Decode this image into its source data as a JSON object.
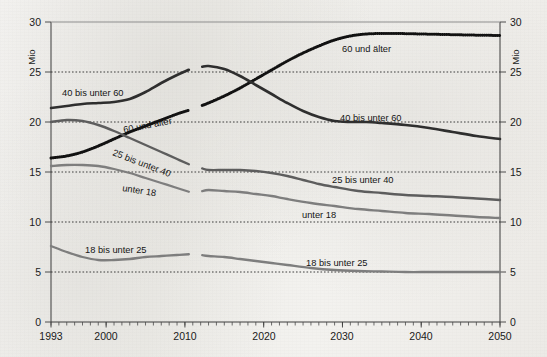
{
  "chart_data": {
    "type": "line",
    "title": "",
    "xlabel": "",
    "ylabel": "Mio",
    "unit_left": "Mio",
    "unit_right": "Mio",
    "xlim": [
      1993,
      2050
    ],
    "ylim": [
      0,
      30
    ],
    "yticks": [
      0,
      5,
      10,
      15,
      20,
      25,
      30
    ],
    "xticks": [
      1993,
      2000,
      2010,
      2020,
      2030,
      2040,
      2050
    ],
    "xtick_labels": [
      "1993",
      "2000",
      "2010",
      "2020",
      "2030",
      "2040",
      "2050"
    ],
    "ytick_labels": [
      "0",
      "5",
      "10",
      "15",
      "20",
      "25",
      "30"
    ],
    "grid": "horizontal-dotted",
    "legend": "inline-annotations",
    "break_year": 2011,
    "series": [
      {
        "name": "60 und älter",
        "style": "dotted-dark",
        "x": [
          1993,
          1995,
          1997,
          1999,
          2001,
          2003,
          2005,
          2007,
          2009,
          2011,
          2013,
          2015,
          2017,
          2019,
          2021,
          2023,
          2025,
          2027,
          2029,
          2031,
          2033,
          2035,
          2037,
          2040,
          2043,
          2046,
          2050
        ],
        "values": [
          16.4,
          16.6,
          17.0,
          17.6,
          18.3,
          19.0,
          19.6,
          20.2,
          20.8,
          21.3,
          21.9,
          22.6,
          23.4,
          24.3,
          25.2,
          26.1,
          26.9,
          27.6,
          28.2,
          28.6,
          28.8,
          28.85,
          28.85,
          28.8,
          28.75,
          28.7,
          28.65
        ]
      },
      {
        "name": "40 bis unter 60",
        "style": "solid-dark",
        "x": [
          1993,
          1995,
          1997,
          1999,
          2001,
          2003,
          2005,
          2007,
          2009,
          2011,
          2013,
          2015,
          2017,
          2019,
          2021,
          2023,
          2025,
          2027,
          2029,
          2031,
          2033,
          2035,
          2038,
          2041,
          2044,
          2047,
          2050
        ],
        "values": [
          21.4,
          21.6,
          21.8,
          21.9,
          22.0,
          22.3,
          23.0,
          23.9,
          24.7,
          25.4,
          25.6,
          25.3,
          24.6,
          23.7,
          22.8,
          21.9,
          21.1,
          20.5,
          20.1,
          20.0,
          20.0,
          19.9,
          19.7,
          19.4,
          19.0,
          18.6,
          18.3
        ]
      },
      {
        "name": "25 bis unter 40",
        "style": "solid-mid",
        "x": [
          1993,
          1995,
          1997,
          1999,
          2001,
          2003,
          2005,
          2007,
          2009,
          2011,
          2013,
          2015,
          2017,
          2019,
          2021,
          2023,
          2025,
          2027,
          2029,
          2032,
          2035,
          2038,
          2041,
          2044,
          2047,
          2050
        ],
        "values": [
          20.0,
          20.2,
          20.1,
          19.7,
          19.1,
          18.4,
          17.7,
          17.0,
          16.3,
          15.6,
          15.2,
          15.2,
          15.2,
          15.1,
          14.9,
          14.6,
          14.2,
          13.8,
          13.5,
          13.1,
          12.9,
          12.7,
          12.6,
          12.5,
          12.35,
          12.2
        ]
      },
      {
        "name": "unter 18",
        "style": "solid-light",
        "x": [
          1993,
          1995,
          1997,
          1999,
          2001,
          2003,
          2005,
          2007,
          2009,
          2011,
          2013,
          2015,
          2017,
          2019,
          2021,
          2023,
          2026,
          2029,
          2032,
          2035,
          2038,
          2041,
          2044,
          2047,
          2050
        ],
        "values": [
          15.6,
          15.7,
          15.7,
          15.6,
          15.3,
          14.9,
          14.4,
          13.9,
          13.4,
          12.9,
          13.2,
          13.1,
          13.0,
          12.8,
          12.6,
          12.3,
          11.9,
          11.6,
          11.3,
          11.1,
          10.9,
          10.8,
          10.65,
          10.5,
          10.4
        ]
      },
      {
        "name": "18 bis unter 25",
        "style": "solid-light",
        "x": [
          1993,
          1995,
          1997,
          1999,
          2001,
          2003,
          2005,
          2007,
          2009,
          2011,
          2013,
          2015,
          2017,
          2019,
          2021,
          2023,
          2026,
          2029,
          2032,
          2035,
          2038,
          2041,
          2044,
          2047,
          2050
        ],
        "values": [
          7.6,
          7.0,
          6.5,
          6.2,
          6.2,
          6.3,
          6.5,
          6.6,
          6.7,
          6.8,
          6.6,
          6.5,
          6.3,
          6.1,
          5.9,
          5.7,
          5.4,
          5.2,
          5.1,
          5.05,
          5.0,
          5.0,
          5.0,
          5.0,
          5.0
        ]
      }
    ],
    "annotations": [
      {
        "text": "60 und älter",
        "series": "60 und älter",
        "placement": "right-upper"
      },
      {
        "text": "60 und älter",
        "series": "60 und älter",
        "placement": "left-rotated"
      },
      {
        "text": "40 bis unter 60",
        "series": "40 bis unter 60",
        "placement": "left-upper"
      },
      {
        "text": "40 bis unter 60",
        "series": "40 bis unter 60",
        "placement": "right-mid"
      },
      {
        "text": "25 bis unter 40",
        "series": "25 bis unter 40",
        "placement": "left-rotated"
      },
      {
        "text": "25 bis unter 40",
        "series": "25 bis unter 40",
        "placement": "right-lower"
      },
      {
        "text": "unter 18",
        "series": "unter 18",
        "placement": "left-rotated"
      },
      {
        "text": "unter 18",
        "series": "unter 18",
        "placement": "right-lower"
      },
      {
        "text": "18 bis unter 25",
        "series": "18 bis unter 25",
        "placement": "left-lower"
      },
      {
        "text": "18 bis unter 25",
        "series": "18 bis unter 25",
        "placement": "right-bottom"
      }
    ]
  },
  "labels": {
    "unit_left": "Mio",
    "unit_right": "Mio",
    "y_30_left": "30",
    "y_25_left": "25",
    "y_20_left": "20",
    "y_15_left": "15",
    "y_10_left": "10",
    "y_5_left": "5",
    "y_0_left": "0",
    "y_30_right": "30",
    "y_25_right": "25",
    "y_20_right": "20",
    "y_15_right": "15",
    "y_10_right": "10",
    "y_5_right": "5",
    "y_0_right": "0",
    "x_1993": "1993",
    "x_2000": "2000",
    "x_2010": "2010",
    "x_2020": "2020",
    "x_2030": "2030",
    "x_2040": "2040",
    "x_2050": "2050",
    "s60_right": "60 und älter",
    "s60_left": "60 und älter",
    "s4060_left": "40 bis unter 60",
    "s4060_right": "40 bis unter 60",
    "s2540_left": "25 bis unter 40",
    "s2540_right": "25 bis unter 40",
    "su18_left": "unter 18",
    "su18_right": "unter 18",
    "s1825_left": "18 bis unter 25",
    "s1825_right": "18 bis unter 25"
  },
  "colors": {
    "background": "#f2f1ef",
    "line_dark": "#2e2e2e",
    "line_mid": "#5d5d5d",
    "line_light": "#7e7e7e",
    "axis": "#3a3a3a",
    "grid": "#2b2b2b"
  }
}
